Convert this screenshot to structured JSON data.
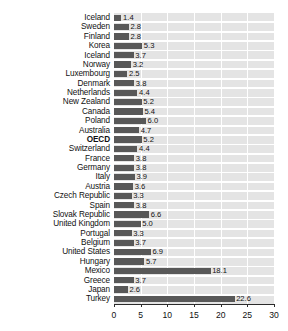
{
  "chart_data": {
    "type": "bar",
    "orientation": "horizontal",
    "title": "",
    "subtitle": "",
    "xlabel": "",
    "ylabel": "",
    "xlim": [
      0,
      30
    ],
    "xticks": [
      0,
      5,
      10,
      15,
      20,
      25,
      30
    ],
    "xtick_labels": [
      "0",
      "5",
      "10",
      "15",
      "20",
      "25",
      "30"
    ],
    "grid": true,
    "grid_axis": "x",
    "legend": null,
    "bar_color": "#585858",
    "plot_background": "#e4e4e4",
    "highlight_category": "OECD",
    "categories": [
      "Iceland",
      "Sweden",
      "Finland",
      "Korea",
      "Iceland",
      "Norway",
      "Luxembourg",
      "Denmark",
      "Netherlands",
      "New Zealand",
      "Canada",
      "Poland",
      "Australia",
      "OECD",
      "Switzerland",
      "France",
      "Germany",
      "Italy",
      "Austria",
      "Czech Republic",
      "Spain",
      "Slovak Republic",
      "United Kingdom",
      "Portugal",
      "Belgium",
      "United States",
      "Hungary",
      "Mexico",
      "Greece",
      "Japan",
      "Turkey"
    ],
    "values": [
      1.4,
      2.8,
      2.8,
      5.3,
      3.7,
      3.2,
      2.5,
      3.8,
      4.4,
      5.2,
      5.4,
      6.0,
      4.7,
      5.2,
      4.4,
      3.8,
      3.8,
      3.9,
      3.6,
      3.3,
      3.8,
      6.6,
      5.0,
      3.3,
      3.7,
      6.9,
      5.7,
      18.1,
      3.7,
      2.6,
      22.6
    ],
    "value_labels": [
      "1.4",
      "2.8",
      "2.8",
      "5.3",
      "3.7",
      "3.2",
      "2.5",
      "3.8",
      "4.4",
      "5.2",
      "5.4",
      "6.0",
      "4.7",
      "5.2",
      "4.4",
      "3.8",
      "3.8",
      "3.9",
      "3.6",
      "3.3",
      "3.8",
      "6.6",
      "5.0",
      "3.3",
      "3.7",
      "6.9",
      "5.7",
      "18.1",
      "3.7",
      "2.6",
      "22.6"
    ]
  }
}
